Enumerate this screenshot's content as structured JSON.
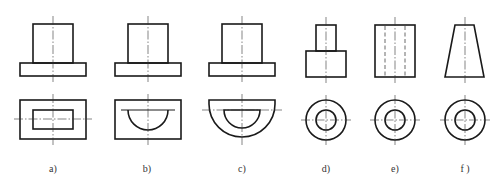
{
  "figure": {
    "stroke_color": "#1a1a1a",
    "background": "#ffffff",
    "panels": [
      {
        "id": "a",
        "label": "a)",
        "label_x": 53,
        "front_view": "rectangular block on wider rectangular base",
        "top_view": "rectangle inside rectangle"
      },
      {
        "id": "b",
        "label": "b)",
        "label_x": 147,
        "front_view": "rectangular block on wider rectangular base",
        "top_view": "half-circle inside rectangle"
      },
      {
        "id": "c",
        "label": "c)",
        "label_x": 242,
        "front_view": "rectangular block on wider rectangular base",
        "top_view": "half-circle inside larger half-disc"
      },
      {
        "id": "d",
        "label": "d)",
        "label_x": 326,
        "front_view": "small cylinder on larger cylinder",
        "top_view": "concentric circles"
      },
      {
        "id": "e",
        "label": "e)",
        "label_x": 395,
        "front_view": "cylinder with hidden bore lines",
        "top_view": "concentric circles"
      },
      {
        "id": "f",
        "label": "f )",
        "label_x": 465,
        "front_view": "truncated cone (trapezoid)",
        "top_view": "concentric circles"
      }
    ]
  }
}
